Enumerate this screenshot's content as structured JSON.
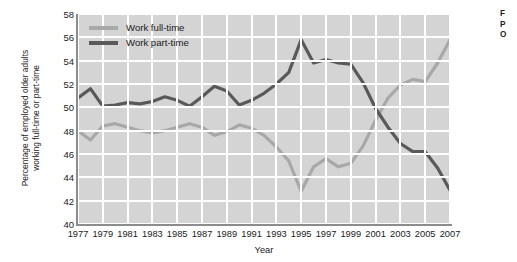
{
  "chart_data": {
    "type": "line",
    "title": "",
    "xlabel": "Year",
    "ylabel": "Percentage of employed older adults working full-time or part-time",
    "ylabel_line1": "Percentage of employed older adults",
    "ylabel_line2": "working full-time or part-time",
    "xlim": [
      1977,
      2007
    ],
    "ylim": [
      40,
      58
    ],
    "yticks": [
      58,
      56,
      54,
      52,
      50,
      48,
      46,
      44,
      42,
      40
    ],
    "xticks": [
      1977,
      1979,
      1981,
      1983,
      1985,
      1987,
      1989,
      1991,
      1993,
      1995,
      1997,
      1999,
      2001,
      2003,
      2005,
      2007
    ],
    "grid": true,
    "grid_color": "#ffffff",
    "plot_background": "#d4d4d4",
    "legend_position": "top-left-inside",
    "x": [
      1977,
      1978,
      1979,
      1980,
      1981,
      1982,
      1983,
      1984,
      1985,
      1986,
      1987,
      1988,
      1989,
      1990,
      1991,
      1992,
      1993,
      1994,
      1995,
      1996,
      1997,
      1998,
      1999,
      2000,
      2001,
      2002,
      2003,
      2004,
      2005,
      2006,
      2007
    ],
    "series": [
      {
        "name": "Work full-time",
        "color": "#a8a8a8",
        "values": [
          48.0,
          47.2,
          48.4,
          48.6,
          48.3,
          48.0,
          47.8,
          48.0,
          48.3,
          48.6,
          48.3,
          47.6,
          47.9,
          48.5,
          48.2,
          47.6,
          46.6,
          45.4,
          42.8,
          44.9,
          45.6,
          44.9,
          45.2,
          46.7,
          48.9,
          50.8,
          51.9,
          52.4,
          52.2,
          53.8,
          55.8
        ]
      },
      {
        "name": "Work part-time",
        "color": "#595959",
        "values": [
          50.8,
          51.6,
          50.1,
          50.2,
          50.4,
          50.3,
          50.5,
          50.9,
          50.6,
          50.1,
          50.9,
          51.8,
          51.4,
          50.2,
          50.6,
          51.2,
          52.0,
          53.0,
          55.8,
          53.8,
          54.1,
          53.8,
          53.7,
          52.1,
          49.9,
          48.3,
          46.9,
          46.2,
          46.2,
          44.8,
          42.9
        ]
      }
    ]
  },
  "legend": {
    "items": [
      {
        "label": "Work full-time",
        "color": "#a8a8a8"
      },
      {
        "label": "Work part-time",
        "color": "#595959"
      }
    ]
  },
  "side_caption": {
    "line1": "F",
    "line2": "P",
    "line3": "O"
  }
}
